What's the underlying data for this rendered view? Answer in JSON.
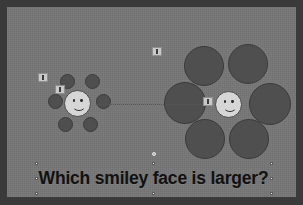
{
  "slide": {
    "background_color": "#767676",
    "frame_color": "#3a3a3a",
    "caption": "Which smiley face is larger?",
    "caption_color": "#111111"
  },
  "illusion": {
    "name": "ebbinghaus-illusion",
    "left_group": {
      "label": "small-surround-group",
      "center_face": {
        "cx": 77,
        "cy": 103,
        "r": 13.5,
        "fill": "#d6d6d6"
      },
      "surround_color": "#4f4f4f",
      "surround_circles": [
        {
          "cx": 67,
          "cy": 81,
          "r": 7.5
        },
        {
          "cx": 92,
          "cy": 81,
          "r": 7.5
        },
        {
          "cx": 55,
          "cy": 101,
          "r": 7.5
        },
        {
          "cx": 103,
          "cy": 101,
          "r": 7.5
        },
        {
          "cx": 65,
          "cy": 124,
          "r": 7.5
        },
        {
          "cx": 90,
          "cy": 124,
          "r": 7.5
        }
      ]
    },
    "right_group": {
      "label": "large-surround-group",
      "center_face": {
        "cx": 228,
        "cy": 104,
        "r": 13.5,
        "fill": "#d6d6d6"
      },
      "surround_color": "#4f4f4f",
      "surround_circles": [
        {
          "cx": 204,
          "cy": 66,
          "r": 20
        },
        {
          "cx": 248,
          "cy": 64,
          "r": 20
        },
        {
          "cx": 185,
          "cy": 103,
          "r": 21
        },
        {
          "cx": 270,
          "cy": 104,
          "r": 21
        },
        {
          "cx": 205,
          "cy": 139,
          "r": 20
        },
        {
          "cx": 249,
          "cy": 139,
          "r": 20
        }
      ]
    },
    "connector": {
      "x1": 96,
      "y1": 104,
      "x2": 212,
      "y2": 104,
      "style": "dotted"
    }
  },
  "markers": [
    {
      "name": "annotation-marker-1",
      "x": 38,
      "y": 73,
      "w": 10,
      "h": 9
    },
    {
      "name": "annotation-marker-2",
      "x": 55,
      "y": 85,
      "w": 10,
      "h": 9
    },
    {
      "name": "annotation-marker-3",
      "x": 152,
      "y": 47,
      "w": 10,
      "h": 9
    },
    {
      "name": "annotation-marker-4",
      "x": 203,
      "y": 97,
      "w": 10,
      "h": 9
    }
  ],
  "selection": {
    "target": "caption-textbox",
    "box": {
      "x": 36,
      "y": 163,
      "w": 235,
      "h": 30
    },
    "handles": [
      {
        "name": "handle-top-left",
        "x": 35,
        "y": 162
      },
      {
        "name": "handle-top-center",
        "x": 152,
        "y": 162
      },
      {
        "name": "handle-top-right",
        "x": 270,
        "y": 162
      },
      {
        "name": "handle-middle-left",
        "x": 35,
        "y": 177
      },
      {
        "name": "handle-middle-right",
        "x": 270,
        "y": 177
      },
      {
        "name": "handle-bottom-left",
        "x": 35,
        "y": 192
      },
      {
        "name": "handle-bottom-center",
        "x": 152,
        "y": 192
      },
      {
        "name": "handle-bottom-right",
        "x": 270,
        "y": 192
      }
    ],
    "rotation_handle": {
      "name": "rotation-handle",
      "x": 152,
      "y": 152
    }
  }
}
